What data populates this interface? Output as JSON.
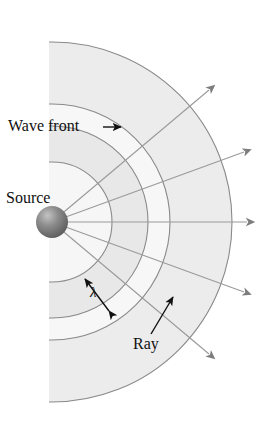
{
  "figure": {
    "title_labels": {
      "wave_front": "Wave front",
      "source": "Source",
      "wavelength": "λ",
      "ray": "Ray"
    },
    "colors": {
      "band_light": "#f4f4f4",
      "band_dark": "#e6e6e6",
      "arc_stroke": "#8a8a8a",
      "ray_stroke": "#8f8f8f",
      "arrow_fill": "#7d7d7d",
      "sphere_dark": "#6b6b6b",
      "sphere_light": "#bdbdbd",
      "label_text": "#111111",
      "background": "#ffffff"
    },
    "source": {
      "cx": 52,
      "cy": 222,
      "r": 16
    },
    "wavefronts": [
      {
        "index": 1,
        "radius": 60
      },
      {
        "index": 2,
        "radius": 96
      },
      {
        "index": 3,
        "radius": 118
      },
      {
        "index": 4,
        "radius": 180
      }
    ],
    "clip_left_x": 49,
    "rays": [
      {
        "index": 1,
        "angle_deg": -40,
        "length": 205
      },
      {
        "index": 2,
        "angle_deg": -20,
        "length": 205
      },
      {
        "index": 3,
        "angle_deg": 0,
        "length": 203
      },
      {
        "index": 4,
        "angle_deg": 20,
        "length": 205
      },
      {
        "index": 5,
        "angle_deg": 40,
        "length": 205
      }
    ],
    "annotations": {
      "wave_front_pointer": {
        "from_x": 103,
        "from_y": 128,
        "to_x": 122,
        "to_y": 128
      },
      "lambda_arrow": {
        "x1": 110,
        "y1": 312,
        "x2": 84,
        "y2": 277
      },
      "ray_pointer": {
        "from_x": 152,
        "from_y": 334,
        "to_x": 173,
        "to_y": 298
      }
    }
  }
}
